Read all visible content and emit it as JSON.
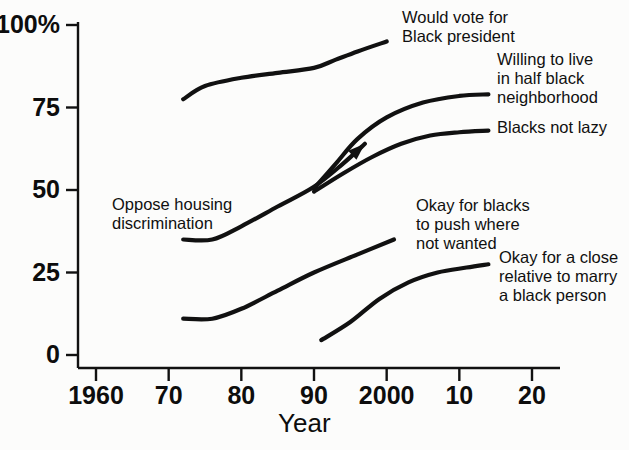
{
  "chart_data": {
    "type": "line",
    "title": "",
    "subtitle": "",
    "xlabel": "Year",
    "ylabel": "",
    "xlim": [
      1960,
      2020
    ],
    "ylim": [
      0,
      100
    ],
    "grid": false,
    "legend_position": "inline-annotations",
    "x_ticks": [
      {
        "value": 1960,
        "label": "1960"
      },
      {
        "value": 1970,
        "label": "70"
      },
      {
        "value": 1980,
        "label": "80"
      },
      {
        "value": 1990,
        "label": "90"
      },
      {
        "value": 2000,
        "label": "2000"
      },
      {
        "value": 2010,
        "label": "10"
      },
      {
        "value": 2020,
        "label": "20"
      }
    ],
    "y_ticks": [
      {
        "value": 100,
        "label": "100%"
      },
      {
        "value": 75,
        "label": "75"
      },
      {
        "value": 50,
        "label": "50"
      },
      {
        "value": 25,
        "label": "25"
      },
      {
        "value": 0,
        "label": "0"
      }
    ],
    "series": [
      {
        "name": "Would vote for Black president",
        "label": "Would vote for\nBlack president",
        "label_x": 402,
        "label_y": 8,
        "color": "#111111",
        "arrow_end": false,
        "points": [
          {
            "x": 1972,
            "y": 77.5
          },
          {
            "x": 1975,
            "y": 81.5
          },
          {
            "x": 1980,
            "y": 84.0
          },
          {
            "x": 1985,
            "y": 85.5
          },
          {
            "x": 1990,
            "y": 87.0
          },
          {
            "x": 1993,
            "y": 89.5
          },
          {
            "x": 1996,
            "y": 92.0
          },
          {
            "x": 2000,
            "y": 95.0
          }
        ]
      },
      {
        "name": "Willing to live in half black neighborhood",
        "label": "Willing to live\nin half black\nneighborhood",
        "label_x": 497,
        "label_y": 50,
        "color": "#111111",
        "arrow_end": false,
        "points": [
          {
            "x": 1990,
            "y": 50.5
          },
          {
            "x": 1993,
            "y": 58.0
          },
          {
            "x": 1996,
            "y": 65.5
          },
          {
            "x": 2000,
            "y": 72.0
          },
          {
            "x": 2005,
            "y": 76.5
          },
          {
            "x": 2010,
            "y": 78.5
          },
          {
            "x": 2014,
            "y": 79.0
          }
        ]
      },
      {
        "name": "Blacks not lazy",
        "label": "Blacks not lazy",
        "label_x": 497,
        "label_y": 118,
        "color": "#111111",
        "arrow_end": false,
        "points": [
          {
            "x": 1990,
            "y": 49.5
          },
          {
            "x": 1994,
            "y": 55.0
          },
          {
            "x": 1998,
            "y": 60.0
          },
          {
            "x": 2002,
            "y": 64.0
          },
          {
            "x": 2006,
            "y": 66.5
          },
          {
            "x": 2010,
            "y": 67.5
          },
          {
            "x": 2014,
            "y": 68.0
          }
        ]
      },
      {
        "name": "Oppose housing discrimination",
        "label": "Oppose housing\ndiscrimination",
        "label_x": 112,
        "label_y": 195,
        "color": "#111111",
        "arrow_end": true,
        "points": [
          {
            "x": 1972,
            "y": 35.0
          },
          {
            "x": 1976,
            "y": 35.0
          },
          {
            "x": 1980,
            "y": 39.0
          },
          {
            "x": 1985,
            "y": 45.0
          },
          {
            "x": 1990,
            "y": 51.0
          },
          {
            "x": 1994,
            "y": 58.0
          },
          {
            "x": 1997,
            "y": 64.0
          }
        ]
      },
      {
        "name": "Okay for blacks to push where not wanted",
        "label": "Okay for blacks\nto push where\nnot wanted",
        "label_x": 416,
        "label_y": 196,
        "color": "#111111",
        "arrow_end": false,
        "points": [
          {
            "x": 1972,
            "y": 11.0
          },
          {
            "x": 1976,
            "y": 11.0
          },
          {
            "x": 1980,
            "y": 14.0
          },
          {
            "x": 1985,
            "y": 19.5
          },
          {
            "x": 1990,
            "y": 25.0
          },
          {
            "x": 1996,
            "y": 30.5
          },
          {
            "x": 2001,
            "y": 35.0
          }
        ]
      },
      {
        "name": "Okay for a close relative to marry a black person",
        "label": "Okay for a close\nrelative to marry\na black person",
        "label_x": 499,
        "label_y": 248,
        "color": "#111111",
        "arrow_end": false,
        "points": [
          {
            "x": 1991,
            "y": 4.5
          },
          {
            "x": 1995,
            "y": 10.0
          },
          {
            "x": 1999,
            "y": 17.0
          },
          {
            "x": 2003,
            "y": 22.0
          },
          {
            "x": 2007,
            "y": 25.0
          },
          {
            "x": 2011,
            "y": 26.5
          },
          {
            "x": 2014,
            "y": 27.5
          }
        ]
      }
    ]
  },
  "axes": {
    "x_axis_title": "Year",
    "y_axis_title": ""
  }
}
